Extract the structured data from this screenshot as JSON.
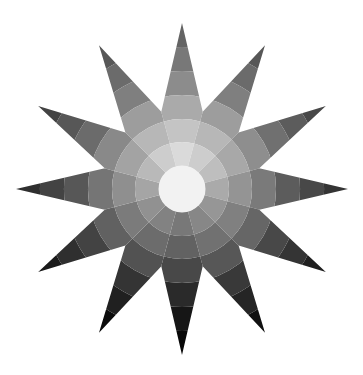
{
  "figure": {
    "title": "",
    "type": "grayscale twelve-point color star",
    "center": [
      182,
      189
    ],
    "spokes": 12,
    "outer_radius": 166,
    "inner_radius": 80,
    "ring_radii": [
      23,
      47,
      70,
      94,
      118,
      142,
      166
    ],
    "center_gray": "#f2f2f2",
    "spoke_base_gray": [
      218,
      205,
      190,
      170,
      150,
      135,
      120,
      130,
      145,
      165,
      185,
      205
    ],
    "ring_darkening": [
      0,
      22,
      48,
      78,
      98,
      118
    ]
  }
}
